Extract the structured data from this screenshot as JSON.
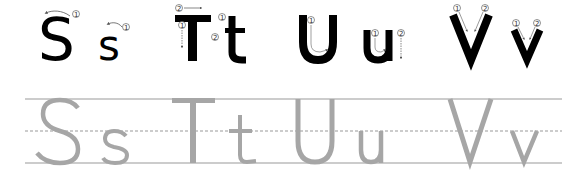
{
  "colors": {
    "stroke_letter": "#000000",
    "trace_letter": "#a6a6a6",
    "guide_line": "#999999",
    "arrow": "#555555"
  },
  "stroke_order_row": {
    "letters": [
      {
        "char": "S",
        "case": "upper",
        "strokes": [
          "1"
        ]
      },
      {
        "char": "s",
        "case": "lower",
        "strokes": [
          "1"
        ]
      },
      {
        "char": "T",
        "case": "upper",
        "strokes": [
          "1",
          "2"
        ]
      },
      {
        "char": "t",
        "case": "lower",
        "strokes": [
          "1",
          "2"
        ]
      },
      {
        "char": "U",
        "case": "upper",
        "strokes": [
          "1"
        ]
      },
      {
        "char": "u",
        "case": "lower",
        "strokes": [
          "1",
          "2"
        ]
      },
      {
        "char": "V",
        "case": "upper",
        "strokes": [
          "1",
          "2"
        ]
      },
      {
        "char": "v",
        "case": "lower",
        "strokes": [
          "1",
          "2"
        ]
      }
    ],
    "stroke_labels": {
      "one": "①",
      "two": "②"
    }
  },
  "tracing_row": {
    "letters": [
      "S",
      "s",
      "T",
      "t",
      "U",
      "u",
      "V",
      "v"
    ],
    "guides": [
      "top-line",
      "dashed-midline",
      "baseline"
    ]
  }
}
